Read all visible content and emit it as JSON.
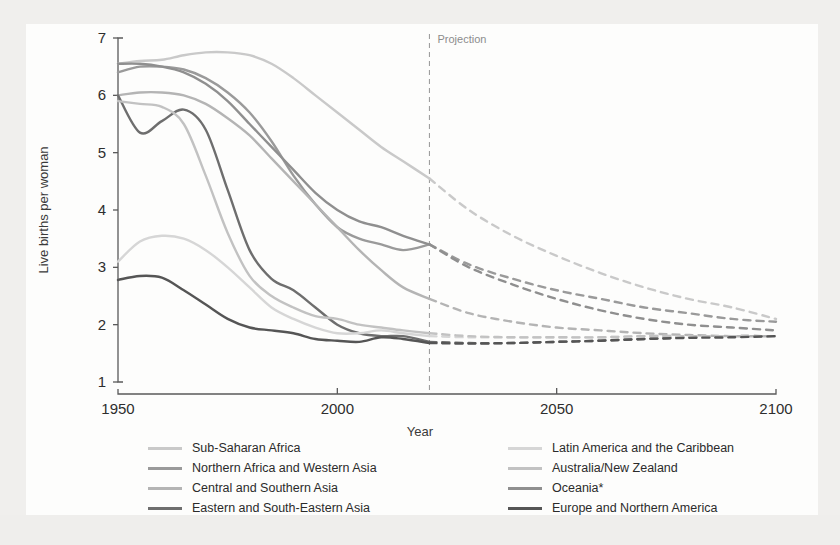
{
  "chart_data": {
    "type": "line",
    "title": "",
    "xlabel": "Year",
    "ylabel": "Live births per woman",
    "xlim": [
      1950,
      2100
    ],
    "ylim": [
      1,
      7
    ],
    "xticks": [
      "1950",
      "2000",
      "2050",
      "2100"
    ],
    "xtick_values": [
      1950,
      2000,
      2050,
      2100
    ],
    "yticks": [
      "1",
      "2",
      "3",
      "4",
      "5",
      "6",
      "7"
    ],
    "ytick_values": [
      1,
      2,
      3,
      4,
      5,
      6,
      7
    ],
    "grid": false,
    "legend_position": "bottom",
    "annotations": [
      {
        "text": "Projection",
        "x": 2021,
        "y": 6.75,
        "type": "divider-label"
      }
    ],
    "projection_start_year": 2021,
    "projection_divider_style": "dashed vertical line",
    "line_style_note": "solid before 2021, dashed after 2021",
    "x": [
      1950,
      1955,
      1960,
      1965,
      1970,
      1975,
      1980,
      1985,
      1990,
      1995,
      2000,
      2005,
      2010,
      2015,
      2021,
      2030,
      2040,
      2050,
      2060,
      2070,
      2080,
      2090,
      2100
    ],
    "series": [
      {
        "name": "Sub-Saharan Africa",
        "color": "#c9c9c9",
        "values": [
          6.55,
          6.6,
          6.62,
          6.7,
          6.75,
          6.75,
          6.7,
          6.55,
          6.3,
          6.0,
          5.7,
          5.4,
          5.1,
          4.85,
          4.55,
          4.0,
          3.55,
          3.2,
          2.9,
          2.65,
          2.45,
          2.3,
          2.1
        ]
      },
      {
        "name": "Northern Africa and Western Asia",
        "color": "#9a9a9a",
        "values": [
          6.4,
          6.5,
          6.5,
          6.45,
          6.3,
          6.05,
          5.7,
          5.2,
          4.6,
          4.1,
          3.7,
          3.5,
          3.4,
          3.3,
          3.4,
          3.05,
          2.8,
          2.6,
          2.45,
          2.3,
          2.2,
          2.1,
          2.05
        ]
      },
      {
        "name": "Central and Southern Asia",
        "color": "#b4b4b4",
        "values": [
          6.0,
          6.05,
          6.05,
          6.0,
          5.85,
          5.6,
          5.3,
          4.9,
          4.5,
          4.1,
          3.7,
          3.3,
          2.95,
          2.65,
          2.45,
          2.2,
          2.05,
          1.95,
          1.9,
          1.85,
          1.82,
          1.8,
          1.8
        ]
      },
      {
        "name": "Eastern and South-Eastern Asia",
        "color": "#6e6e6e",
        "values": [
          6.0,
          5.35,
          5.55,
          5.75,
          5.4,
          4.35,
          3.3,
          2.8,
          2.6,
          2.3,
          2.0,
          1.85,
          1.8,
          1.8,
          1.7,
          1.68,
          1.68,
          1.7,
          1.72,
          1.75,
          1.78,
          1.8,
          1.8
        ]
      },
      {
        "name": "Latin America and the Caribbean",
        "color": "#d6d6d6",
        "values": [
          3.1,
          3.45,
          3.55,
          3.5,
          3.3,
          3.0,
          2.65,
          2.3,
          2.1,
          1.95,
          1.85,
          1.85,
          1.9,
          1.85,
          1.8,
          1.78,
          1.78,
          1.78,
          1.78,
          1.8,
          1.8,
          1.8,
          1.8
        ]
      },
      {
        "name": "Australia/New Zealand",
        "color": "#c2c2c2",
        "values": [
          5.9,
          5.85,
          5.8,
          5.5,
          4.6,
          3.6,
          2.85,
          2.5,
          2.3,
          2.15,
          2.1,
          2.0,
          1.95,
          1.9,
          1.85,
          1.8,
          1.78,
          1.78,
          1.78,
          1.8,
          1.8,
          1.8,
          1.8
        ]
      },
      {
        "name": "Oceania*",
        "color": "#8f8f8f",
        "values": [
          6.55,
          6.55,
          6.5,
          6.4,
          6.2,
          5.9,
          5.5,
          5.1,
          4.7,
          4.3,
          4.0,
          3.8,
          3.7,
          3.55,
          3.4,
          3.0,
          2.7,
          2.45,
          2.25,
          2.1,
          2.0,
          1.95,
          1.9
        ]
      },
      {
        "name": "Europe and Northern America",
        "color": "#555555",
        "values": [
          2.78,
          2.85,
          2.82,
          2.6,
          2.35,
          2.1,
          1.95,
          1.9,
          1.85,
          1.75,
          1.72,
          1.7,
          1.78,
          1.75,
          1.68,
          1.67,
          1.68,
          1.7,
          1.72,
          1.75,
          1.77,
          1.78,
          1.8
        ]
      }
    ]
  },
  "axes": {
    "ylabel": "Live births per woman",
    "xlabel": "Year",
    "xticks": [
      "1950",
      "2000",
      "2050",
      "2100"
    ],
    "yticks": [
      "7",
      "6",
      "5",
      "4",
      "3",
      "2",
      "1"
    ]
  },
  "projection": {
    "label": "Projection"
  },
  "legend": {
    "left_column": [
      {
        "label": "Sub-Saharan Africa",
        "color": "#c9c9c9"
      },
      {
        "label": "Northern Africa and Western Asia",
        "color": "#9a9a9a"
      },
      {
        "label": "Central and Southern Asia",
        "color": "#b4b4b4"
      },
      {
        "label": "Eastern and South-Eastern Asia",
        "color": "#6e6e6e"
      }
    ],
    "right_column": [
      {
        "label": "Latin America and the Caribbean",
        "color": "#d6d6d6"
      },
      {
        "label": "Australia/New Zealand",
        "color": "#c2c2c2"
      },
      {
        "label": "Oceania*",
        "color": "#8f8f8f"
      },
      {
        "label": "Europe and Northern America",
        "color": "#555555"
      }
    ]
  }
}
